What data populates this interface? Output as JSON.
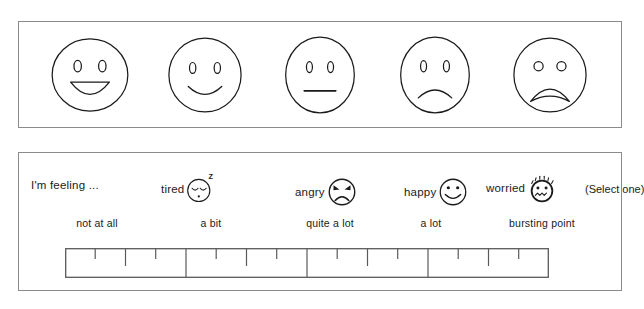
{
  "worksheet": {
    "faces_panel": {
      "name": "emotion-faces-row",
      "faces": [
        {
          "id": "face-very-happy",
          "label": "very happy"
        },
        {
          "id": "face-happy",
          "label": "happy"
        },
        {
          "id": "face-neutral",
          "label": "neutral"
        },
        {
          "id": "face-sad",
          "label": "sad"
        },
        {
          "id": "face-very-sad",
          "label": "very sad"
        }
      ]
    },
    "rating_panel": {
      "prompt": "I'm feeling ...",
      "select_note": "(Select one)",
      "emotions": [
        {
          "label": "tired",
          "icon": "tired-face-icon"
        },
        {
          "label": "angry",
          "icon": "angry-face-icon"
        },
        {
          "label": "happy",
          "icon": "happy-face-icon"
        },
        {
          "label": "worried",
          "icon": "worried-face-icon"
        }
      ],
      "scale_labels": [
        "not at all",
        "a bit",
        "quite a lot",
        "a lot",
        "bursting point"
      ],
      "scale": {
        "sections": 4,
        "minor_ticks_per_section": 3,
        "tall_tick_index": 1
      }
    }
  },
  "colors": {
    "border": "#8a8a8a",
    "ink": "#1a1a1a",
    "paper": "#ffffff"
  }
}
